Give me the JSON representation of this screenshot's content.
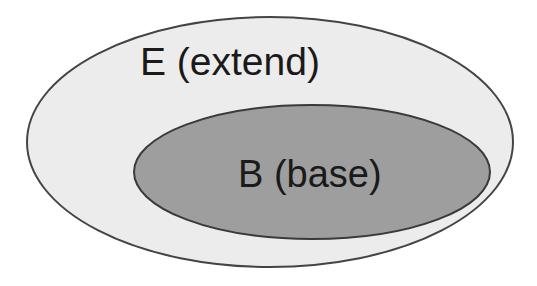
{
  "diagram": {
    "type": "nested-sets",
    "outer": {
      "label": "E (extend)",
      "fill": "#ececec",
      "stroke": "#444444"
    },
    "inner": {
      "label": "B (base)",
      "fill": "#9e9e9e",
      "stroke": "#3a3a3a"
    },
    "relationship": "B is contained within E"
  }
}
